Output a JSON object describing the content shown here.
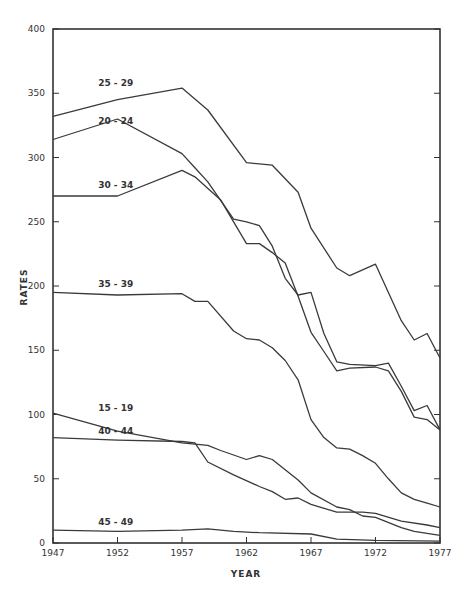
{
  "chart_data": {
    "type": "line",
    "title": "",
    "xlabel": "YEAR",
    "ylabel": "RATES",
    "xlim": [
      1947,
      1977
    ],
    "ylim": [
      0,
      400
    ],
    "x_ticks": [
      1947,
      1952,
      1957,
      1962,
      1967,
      1972,
      1977
    ],
    "y_ticks": [
      0,
      50,
      100,
      150,
      200,
      250,
      300,
      350,
      400
    ],
    "grid": false,
    "legend": "inline labels at left",
    "series": [
      {
        "name": "25 - 29",
        "label_pos": [
          1950.5,
          356
        ],
        "x": [
          1947,
          1952,
          1957,
          1959,
          1962,
          1964,
          1966,
          1967,
          1969,
          1970,
          1972,
          1974,
          1975,
          1976,
          1977
        ],
        "y": [
          332,
          345,
          354,
          337,
          296,
          294,
          273,
          245,
          214,
          208,
          217,
          173,
          158,
          163,
          144
        ]
      },
      {
        "name": "20 - 24",
        "label_pos": [
          1950.5,
          326
        ],
        "x": [
          1947,
          1952,
          1957,
          1958,
          1959,
          1961,
          1962,
          1963,
          1964,
          1965,
          1966,
          1967,
          1968,
          1969,
          1970,
          1972,
          1973,
          1974,
          1975,
          1976,
          1977
        ],
        "y": [
          314,
          330,
          303,
          292,
          281,
          252,
          250,
          247,
          231,
          206,
          193,
          195,
          163,
          141,
          139,
          138,
          140,
          122,
          103,
          107,
          88
        ]
      },
      {
        "name": "30 - 34",
        "label_pos": [
          1950.5,
          276
        ],
        "x": [
          1947,
          1952,
          1957,
          1958,
          1960,
          1961,
          1962,
          1963,
          1964,
          1965,
          1966,
          1967,
          1968,
          1969,
          1970,
          1972,
          1973,
          1974,
          1975,
          1976,
          1977
        ],
        "y": [
          270,
          270,
          290,
          285,
          267,
          250,
          233,
          233,
          226,
          218,
          192,
          164,
          149,
          134,
          136,
          137,
          134,
          118,
          98,
          96,
          88
        ]
      },
      {
        "name": "35 - 39",
        "label_pos": [
          1950.5,
          199
        ],
        "x": [
          1947,
          1952,
          1957,
          1958,
          1959,
          1961,
          1962,
          1963,
          1964,
          1965,
          1966,
          1967,
          1968,
          1969,
          1970,
          1971,
          1972,
          1973,
          1974,
          1975,
          1976,
          1977
        ],
        "y": [
          195,
          193,
          194,
          188,
          188,
          165,
          159,
          158,
          152,
          142,
          127,
          96,
          82,
          74,
          73,
          68,
          62,
          50,
          39,
          34,
          31,
          28
        ]
      },
      {
        "name": "15 - 19",
        "label_pos": [
          1950.5,
          103
        ],
        "x": [
          1947,
          1952,
          1957,
          1959,
          1960,
          1962,
          1963,
          1964,
          1966,
          1967,
          1969,
          1970,
          1971,
          1972,
          1974,
          1975,
          1977
        ],
        "y": [
          101,
          87,
          78,
          76,
          72,
          65,
          68,
          65,
          49,
          39,
          28,
          26,
          21,
          20,
          12,
          9,
          6
        ]
      },
      {
        "name": "40 - 44",
        "label_pos": [
          1950.5,
          85
        ],
        "x": [
          1947,
          1952,
          1957,
          1958,
          1959,
          1961,
          1963,
          1964,
          1965,
          1966,
          1967,
          1969,
          1971,
          1972,
          1974,
          1976,
          1977
        ],
        "y": [
          82,
          80,
          79,
          78,
          63,
          53,
          44,
          40,
          34,
          35,
          30,
          24,
          24,
          23,
          17,
          14,
          12
        ]
      },
      {
        "name": "45 - 49",
        "label_pos": [
          1950.5,
          14
        ],
        "x": [
          1947,
          1952,
          1957,
          1959,
          1961,
          1963,
          1967,
          1969,
          1972,
          1977
        ],
        "y": [
          10,
          9,
          10,
          11,
          9,
          8,
          7,
          3,
          2,
          1.5
        ]
      }
    ]
  },
  "axis": {
    "x_title": "YEAR",
    "y_title": "RATES",
    "x_tick_labels": [
      "1947",
      "1952",
      "1957",
      "1962",
      "1967",
      "1972",
      "1977"
    ],
    "y_tick_labels": [
      "0",
      "50",
      "100",
      "150",
      "200",
      "250",
      "300",
      "350",
      "400"
    ]
  }
}
